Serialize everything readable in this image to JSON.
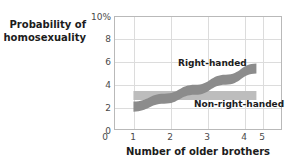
{
  "chart_data": {
    "type": "line",
    "title": "",
    "subtitle": "",
    "ylabel_line1": "Probability of",
    "ylabel_line2": "homosexuality",
    "xlabel": "Number of older brothers",
    "x": [
      1,
      2,
      3,
      4,
      5
    ],
    "xlim": [
      0.4,
      5.8
    ],
    "ylim": [
      0,
      10
    ],
    "xticks": [
      "0",
      "1",
      "2",
      "3",
      "4",
      "5"
    ],
    "yticks": [
      "10%",
      "8",
      "6",
      "4",
      "2",
      "0"
    ],
    "ytick_values": [
      10,
      8,
      6,
      4,
      2,
      0
    ],
    "grid": true,
    "legend_position": "inline-annotation",
    "series": [
      {
        "name": "Right-handed",
        "color": "#8c8c8c",
        "band_width": 0.45,
        "values": [
          2.0,
          2.7,
          3.5,
          4.4,
          5.4
        ]
      },
      {
        "name": "Non-right-handed",
        "color": "#bdbdbd",
        "band_width": 0.4,
        "values": [
          3.0,
          3.0,
          3.0,
          3.0,
          3.0
        ]
      }
    ],
    "annotations": [
      {
        "text": "Right-handed",
        "series": 0
      },
      {
        "text": "Non-right-handed",
        "series": 1
      }
    ]
  },
  "colors": {
    "right_handed": "#8c8c8c",
    "non_right_handed": "#bdbdbd",
    "grid": "#dcdcdc",
    "frame": "#b9b9b9",
    "text": "#1c1c1c",
    "tick_text": "#4a4a4a",
    "background": "#ffffff"
  }
}
